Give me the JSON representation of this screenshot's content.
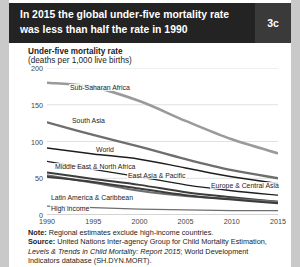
{
  "banner": {
    "title": "In 2015 the global under-five mortality rate was less than half the rate in 1990",
    "badge": "3c"
  },
  "chart_labels": {
    "axis_title": "Under-five mortality rate",
    "axis_subtitle": "(deaths per 1,000 live births)"
  },
  "notes": {
    "note_label": "Note:",
    "note_text": " Regional estimates exclude high-income countries.",
    "source_label": "Source:",
    "source_text_1": " United Nations Inter-agency Group for Child Mortality Estimation, ",
    "source_italic": "Levels & Trends in Child Mortality: Report 2015",
    "source_text_2": "; World Development Indicators database (SH.DYN.MORT)."
  },
  "colors": {
    "banner_bg": "#232323",
    "badge_panel": "#3a3a3a",
    "card_bg": "#ffffff",
    "page_bg": "#c9c9c9",
    "grid": "#d8d8d8",
    "line_light": "#9a9a9a",
    "line_mid": "#6e6e6e",
    "line_dark": "#3c3c3c",
    "line_black": "#1e1e1e"
  },
  "chart_data": {
    "type": "line",
    "title": "Under-five mortality rate",
    "subtitle": "(deaths per 1,000 live births)",
    "xlabel": "",
    "ylabel": "deaths per 1,000 live births",
    "xlim": [
      1990,
      2015
    ],
    "ylim": [
      0,
      200
    ],
    "yticks": [
      0,
      50,
      100,
      150,
      200
    ],
    "xticks": [
      1990,
      1995,
      2000,
      2005,
      2010,
      2015
    ],
    "grid": true,
    "legend_position": "inline-labels",
    "x": [
      1990,
      1995,
      2000,
      2005,
      2010,
      2015
    ],
    "series": [
      {
        "name": "Sub-Saharan Africa",
        "values": [
          180,
          174,
          155,
          128,
          103,
          84
        ],
        "color": "#9a9a9a",
        "width": 2.6,
        "label_x": 60,
        "label_y": 84
      },
      {
        "name": "South Asia",
        "values": [
          126,
          109,
          93,
          76,
          61,
          50
        ],
        "color": "#6e6e6e",
        "width": 2.3,
        "label_x": 62,
        "label_y": 117
      },
      {
        "name": "World",
        "values": [
          91,
          83,
          76,
          64,
          52,
          43
        ],
        "color": "#1e1e1e",
        "width": 1.5,
        "label_x": 86,
        "label_y": 146
      },
      {
        "name": "Middle East & North Africa",
        "values": [
          73,
          62,
          52,
          41,
          33,
          27
        ],
        "color": "#1e1e1e",
        "width": 1.3,
        "label_x": 45,
        "label_y": 163
      },
      {
        "name": "East Asia & Pacific",
        "values": [
          58,
          49,
          41,
          31,
          24,
          18
        ],
        "color": "#3c3c3c",
        "width": 2.0,
        "label_x": 118,
        "label_y": 172
      },
      {
        "name": "Latin America & Caribbean",
        "values": [
          54,
          44,
          33,
          26,
          22,
          18
        ],
        "color": "#6e6e6e",
        "width": 2.0,
        "label_x": 41,
        "label_y": 194
      },
      {
        "name": "Europe & Central Asia",
        "values": [
          52,
          45,
          36,
          27,
          21,
          16
        ],
        "color": "#3c3c3c",
        "width": 2.0,
        "label_x": 201,
        "label_y": 182
      },
      {
        "name": "High income",
        "values": [
          12,
          10,
          8,
          7,
          6,
          6
        ],
        "color": "#6e6e6e",
        "width": 1.2,
        "label_x": 41,
        "label_y": 205
      }
    ]
  }
}
